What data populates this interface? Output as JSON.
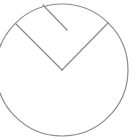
{
  "diagram": {
    "background": "#ffffff",
    "stroke_color": "#8a8a8a",
    "stroke_width": 1.2,
    "circle": {
      "cx": 62,
      "cy": 70,
      "r": 66
    },
    "sector_lines": [
      {
        "name": "left-radius",
        "x1": 62,
        "y1": 70,
        "x2": 16,
        "y2": 24
      },
      {
        "name": "right-radius",
        "x1": 62,
        "y1": 70,
        "x2": 108,
        "y2": 23
      }
    ],
    "inner_segment": {
      "name": "partial-chord-line",
      "x1": 43,
      "y1": 5,
      "x2": 67,
      "y2": 30
    }
  }
}
